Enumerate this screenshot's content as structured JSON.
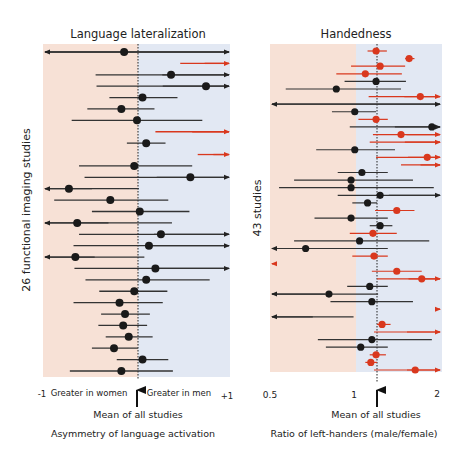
{
  "chart_data": [
    {
      "type": "forest",
      "title": "Language lateralization",
      "ylabel": "26 functional imaging studies",
      "xlabel": "Asymmetry of language activation",
      "x_range": [
        -1,
        1
      ],
      "tick_labels": {
        "left": "-1",
        "right": "+1"
      },
      "region_labels": {
        "left": "Greater in women",
        "right": "Greater in men"
      },
      "mean_label": "Mean of all studies",
      "mean": 0,
      "colors": {
        "left_bg": "#f7e1d6",
        "right_bg": "#e2e8f3",
        "black": "#1a1a1a",
        "line": "#333333",
        "red": "#d9381e"
      },
      "studies": [
        {
          "lo": -1.0,
          "est": -0.14,
          "hi": 1.0,
          "lo_arrow": true,
          "hi_arrow": true,
          "color": "black"
        },
        {
          "lo": 0.47,
          "est": null,
          "hi": 1.0,
          "lo_arrow": false,
          "hi_arrow": true,
          "color": "red"
        },
        {
          "lo": -0.45,
          "est": 0.37,
          "hi": 1.0,
          "lo_arrow": false,
          "hi_arrow": true,
          "color": "black"
        },
        {
          "lo": -0.44,
          "est": 0.75,
          "hi": 1.0,
          "lo_arrow": false,
          "hi_arrow": true,
          "color": "black"
        },
        {
          "lo": -0.3,
          "est": 0.06,
          "hi": 0.44,
          "lo_arrow": false,
          "hi_arrow": false,
          "color": "black"
        },
        {
          "lo": -0.54,
          "est": -0.17,
          "hi": 0.19,
          "lo_arrow": false,
          "hi_arrow": false,
          "color": "black"
        },
        {
          "lo": -0.71,
          "est": 0.0,
          "hi": 0.71,
          "lo_arrow": false,
          "hi_arrow": false,
          "color": "black"
        },
        {
          "lo": 0.2,
          "est": null,
          "hi": 1.0,
          "lo_arrow": false,
          "hi_arrow": true,
          "color": "red"
        },
        {
          "lo": -0.11,
          "est": 0.1,
          "hi": 0.31,
          "lo_arrow": false,
          "hi_arrow": false,
          "color": "black"
        },
        {
          "lo": 0.66,
          "est": null,
          "hi": 1.0,
          "lo_arrow": false,
          "hi_arrow": true,
          "color": "red"
        },
        {
          "lo": -0.63,
          "est": -0.03,
          "hi": 0.6,
          "lo_arrow": false,
          "hi_arrow": false,
          "color": "black"
        },
        {
          "lo": -0.57,
          "est": 0.58,
          "hi": 1.0,
          "lo_arrow": false,
          "hi_arrow": true,
          "color": "black"
        },
        {
          "lo": -1.0,
          "est": -0.74,
          "hi": 0.02,
          "lo_arrow": true,
          "hi_arrow": false,
          "color": "black"
        },
        {
          "lo": -0.9,
          "est": -0.29,
          "hi": 0.34,
          "lo_arrow": false,
          "hi_arrow": false,
          "color": "black"
        },
        {
          "lo": -0.49,
          "est": 0.03,
          "hi": 0.57,
          "lo_arrow": false,
          "hi_arrow": false,
          "color": "black"
        },
        {
          "lo": -1.0,
          "est": -0.65,
          "hi": 0.38,
          "lo_arrow": true,
          "hi_arrow": false,
          "color": "black"
        },
        {
          "lo": -0.63,
          "est": 0.26,
          "hi": 1.0,
          "lo_arrow": false,
          "hi_arrow": true,
          "color": "black"
        },
        {
          "lo": -0.69,
          "est": 0.13,
          "hi": 1.0,
          "lo_arrow": false,
          "hi_arrow": true,
          "color": "black"
        },
        {
          "lo": -1.0,
          "est": -0.67,
          "hi": 0.08,
          "lo_arrow": true,
          "hi_arrow": false,
          "color": "black"
        },
        {
          "lo": -0.68,
          "est": 0.2,
          "hi": 1.0,
          "lo_arrow": false,
          "hi_arrow": true,
          "color": "black"
        },
        {
          "lo": -0.56,
          "est": 0.1,
          "hi": 0.79,
          "lo_arrow": false,
          "hi_arrow": false,
          "color": "black"
        },
        {
          "lo": -0.41,
          "est": -0.03,
          "hi": 0.33,
          "lo_arrow": false,
          "hi_arrow": false,
          "color": "black"
        },
        {
          "lo": -0.69,
          "est": -0.19,
          "hi": 0.28,
          "lo_arrow": false,
          "hi_arrow": false,
          "color": "black"
        },
        {
          "lo": -0.39,
          "est": -0.13,
          "hi": 0.14,
          "lo_arrow": false,
          "hi_arrow": false,
          "color": "black"
        },
        {
          "lo": -0.42,
          "est": -0.15,
          "hi": 0.11,
          "lo_arrow": false,
          "hi_arrow": false,
          "color": "black"
        },
        {
          "lo": -0.34,
          "est": -0.09,
          "hi": 0.17,
          "lo_arrow": false,
          "hi_arrow": false,
          "color": "black"
        },
        {
          "lo": -0.49,
          "est": -0.25,
          "hi": 0.01,
          "lo_arrow": false,
          "hi_arrow": false,
          "color": "black"
        },
        {
          "lo": -0.22,
          "est": 0.06,
          "hi": 0.34,
          "lo_arrow": false,
          "hi_arrow": false,
          "color": "black"
        },
        {
          "lo": -0.73,
          "est": -0.17,
          "hi": 0.39,
          "lo_arrow": false,
          "hi_arrow": false,
          "color": "black"
        }
      ]
    },
    {
      "type": "forest",
      "title": "Handedness",
      "ylabel": "43 studies",
      "xlabel": "Ratio of left-handers (male/female)",
      "x_range": [
        0.5,
        2
      ],
      "x_scale": "log",
      "tick_labels": {
        "min": "0.5",
        "mid": "1",
        "max": "2"
      },
      "mean_label": "Mean of all studies",
      "mean": 1.19,
      "colors": {
        "left_bg": "#f7e1d6",
        "right_bg": "#e2e8f3",
        "black": "#1a1a1a",
        "line": "#333333",
        "red": "#d9381e"
      },
      "studies": [
        {
          "lo": 1.1,
          "est": 1.18,
          "hi": 1.29,
          "lo_arrow": false,
          "hi_arrow": false,
          "color": "red"
        },
        {
          "lo": 1.5,
          "est": 1.55,
          "hi": 1.62,
          "lo_arrow": false,
          "hi_arrow": false,
          "color": "red"
        },
        {
          "lo": 0.96,
          "est": 1.22,
          "hi": 1.5,
          "lo_arrow": false,
          "hi_arrow": false,
          "color": "red"
        },
        {
          "lo": 0.85,
          "est": 1.08,
          "hi": 1.46,
          "lo_arrow": false,
          "hi_arrow": false,
          "color": "red"
        },
        {
          "lo": 0.91,
          "est": 1.18,
          "hi": 1.51,
          "lo_arrow": false,
          "hi_arrow": false,
          "color": "black"
        },
        {
          "lo": 0.56,
          "est": 0.85,
          "hi": 1.45,
          "lo_arrow": false,
          "hi_arrow": false,
          "color": "black"
        },
        {
          "lo": 1.11,
          "est": 1.7,
          "hi": 2.0,
          "lo_arrow": false,
          "hi_arrow": true,
          "color": "red"
        },
        {
          "lo": 0.5,
          "est": null,
          "hi": 2.0,
          "lo_arrow": true,
          "hi_arrow": true,
          "color": "black"
        },
        {
          "lo": 0.82,
          "est": 0.99,
          "hi": 1.18,
          "lo_arrow": false,
          "hi_arrow": false,
          "color": "black"
        },
        {
          "lo": 1.02,
          "est": 1.18,
          "hi": 1.3,
          "lo_arrow": false,
          "hi_arrow": false,
          "color": "red"
        },
        {
          "lo": 0.95,
          "est": 1.87,
          "hi": 2.0,
          "lo_arrow": false,
          "hi_arrow": true,
          "color": "black"
        },
        {
          "lo": 1.15,
          "est": 1.45,
          "hi": 2.0,
          "lo_arrow": false,
          "hi_arrow": true,
          "color": "red"
        },
        {
          "lo": 1.12,
          "est": null,
          "hi": 2.0,
          "lo_arrow": false,
          "hi_arrow": true,
          "color": "red"
        },
        {
          "lo": 0.72,
          "est": 0.99,
          "hi": 1.38,
          "lo_arrow": false,
          "hi_arrow": false,
          "color": "black"
        },
        {
          "lo": 1.18,
          "est": 1.8,
          "hi": 2.0,
          "lo_arrow": false,
          "hi_arrow": true,
          "color": "red"
        },
        {
          "lo": 1.45,
          "est": null,
          "hi": 2.0,
          "lo_arrow": false,
          "hi_arrow": true,
          "color": "red"
        },
        {
          "lo": 0.86,
          "est": 1.05,
          "hi": 1.3,
          "lo_arrow": false,
          "hi_arrow": false,
          "color": "black"
        },
        {
          "lo": 0.6,
          "est": 0.96,
          "hi": 1.6,
          "lo_arrow": false,
          "hi_arrow": false,
          "color": "black"
        },
        {
          "lo": 0.53,
          "est": 0.96,
          "hi": 1.9,
          "lo_arrow": false,
          "hi_arrow": false,
          "color": "black"
        },
        {
          "lo": 0.86,
          "est": 1.22,
          "hi": 2.0,
          "lo_arrow": false,
          "hi_arrow": true,
          "color": "black"
        },
        {
          "lo": 0.97,
          "est": 1.1,
          "hi": 1.19,
          "lo_arrow": false,
          "hi_arrow": false,
          "color": "black"
        },
        {
          "lo": 1.17,
          "est": 1.4,
          "hi": 1.62,
          "lo_arrow": false,
          "hi_arrow": false,
          "color": "red"
        },
        {
          "lo": 0.71,
          "est": 0.96,
          "hi": 1.3,
          "lo_arrow": false,
          "hi_arrow": false,
          "color": "black"
        },
        {
          "lo": 1.12,
          "est": 1.22,
          "hi": 1.35,
          "lo_arrow": false,
          "hi_arrow": false,
          "color": "black"
        },
        {
          "lo": 0.95,
          "est": 1.15,
          "hi": 1.4,
          "lo_arrow": false,
          "hi_arrow": false,
          "color": "red"
        },
        {
          "lo": 0.6,
          "est": 1.03,
          "hi": 1.83,
          "lo_arrow": false,
          "hi_arrow": false,
          "color": "black"
        },
        {
          "lo": 0.5,
          "est": 0.66,
          "hi": 1.3,
          "lo_arrow": true,
          "hi_arrow": false,
          "color": "black"
        },
        {
          "lo": 0.97,
          "est": 1.16,
          "hi": 1.3,
          "lo_arrow": false,
          "hi_arrow": false,
          "color": "red"
        },
        {
          "lo": 0.5,
          "est": null,
          "hi": 0.52,
          "lo_arrow": true,
          "hi_arrow": false,
          "color": "red"
        },
        {
          "lo": 1.14,
          "est": 1.4,
          "hi": 1.72,
          "lo_arrow": false,
          "hi_arrow": false,
          "color": "red"
        },
        {
          "lo": 1.19,
          "est": 1.72,
          "hi": 2.0,
          "lo_arrow": false,
          "hi_arrow": true,
          "color": "red"
        },
        {
          "lo": 0.93,
          "est": 1.12,
          "hi": 1.3,
          "lo_arrow": false,
          "hi_arrow": false,
          "color": "black"
        },
        {
          "lo": 0.5,
          "est": 0.8,
          "hi": 1.2,
          "lo_arrow": true,
          "hi_arrow": false,
          "color": "black"
        },
        {
          "lo": 0.81,
          "est": 1.14,
          "hi": 1.6,
          "lo_arrow": false,
          "hi_arrow": false,
          "color": "black"
        },
        {
          "lo": 1.93,
          "est": null,
          "hi": 2.0,
          "lo_arrow": false,
          "hi_arrow": true,
          "color": "red"
        },
        {
          "lo": 0.5,
          "est": null,
          "hi": 0.98,
          "lo_arrow": true,
          "hi_arrow": false,
          "color": "black"
        },
        {
          "lo": 1.19,
          "est": 1.24,
          "hi": 1.33,
          "lo_arrow": false,
          "hi_arrow": false,
          "color": "red"
        },
        {
          "lo": 1.16,
          "est": null,
          "hi": 2.0,
          "lo_arrow": false,
          "hi_arrow": true,
          "color": "red"
        },
        {
          "lo": 0.73,
          "est": 1.14,
          "hi": 1.87,
          "lo_arrow": false,
          "hi_arrow": false,
          "color": "black"
        },
        {
          "lo": 0.78,
          "est": 1.04,
          "hi": 1.3,
          "lo_arrow": false,
          "hi_arrow": false,
          "color": "black"
        },
        {
          "lo": 1.12,
          "est": 1.18,
          "hi": 1.28,
          "lo_arrow": false,
          "hi_arrow": false,
          "color": "red"
        },
        {
          "lo": 1.08,
          "est": 1.13,
          "hi": 1.19,
          "lo_arrow": false,
          "hi_arrow": false,
          "color": "red"
        },
        {
          "lo": 1.16,
          "est": 1.63,
          "hi": 2.0,
          "lo_arrow": false,
          "hi_arrow": true,
          "color": "red"
        }
      ]
    }
  ]
}
